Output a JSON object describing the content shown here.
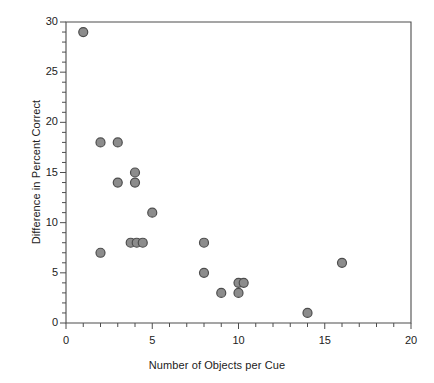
{
  "chart_data": {
    "type": "scatter",
    "title": "",
    "xlabel": "Number of Objects per Cue",
    "ylabel": "Difference in Percent Correct",
    "xlim": [
      0,
      20
    ],
    "ylim": [
      0,
      30
    ],
    "x_major_ticks": [
      0,
      5,
      10,
      15,
      20
    ],
    "x_major_tick_labels": [
      "0",
      "5",
      "10",
      "15",
      "20"
    ],
    "x_minor_tick_step": 1,
    "y_major_ticks": [
      0,
      5,
      10,
      15,
      20,
      25,
      30
    ],
    "y_major_tick_labels": [
      "0",
      "5",
      "10",
      "15",
      "20",
      "25",
      "30"
    ],
    "y_minor_tick_step": 1,
    "grid": false,
    "legend": false,
    "legend_position": "none",
    "marker": {
      "shape": "circle",
      "fill_color": "#8c8c8c",
      "edge_color": "#4d4d4d",
      "size_px": 9
    },
    "frame_color": "#4d4d4d",
    "points": [
      {
        "x": 1.0,
        "y": 29
      },
      {
        "x": 2.0,
        "y": 18
      },
      {
        "x": 3.0,
        "y": 18
      },
      {
        "x": 2.0,
        "y": 7
      },
      {
        "x": 3.0,
        "y": 14
      },
      {
        "x": 4.0,
        "y": 15
      },
      {
        "x": 4.0,
        "y": 14
      },
      {
        "x": 3.75,
        "y": 8
      },
      {
        "x": 4.1,
        "y": 8
      },
      {
        "x": 4.45,
        "y": 8
      },
      {
        "x": 5.0,
        "y": 11
      },
      {
        "x": 8.0,
        "y": 8
      },
      {
        "x": 8.0,
        "y": 5
      },
      {
        "x": 9.0,
        "y": 3
      },
      {
        "x": 10.0,
        "y": 4
      },
      {
        "x": 10.3,
        "y": 4
      },
      {
        "x": 10.0,
        "y": 3
      },
      {
        "x": 14.0,
        "y": 1
      },
      {
        "x": 16.0,
        "y": 6
      }
    ]
  }
}
